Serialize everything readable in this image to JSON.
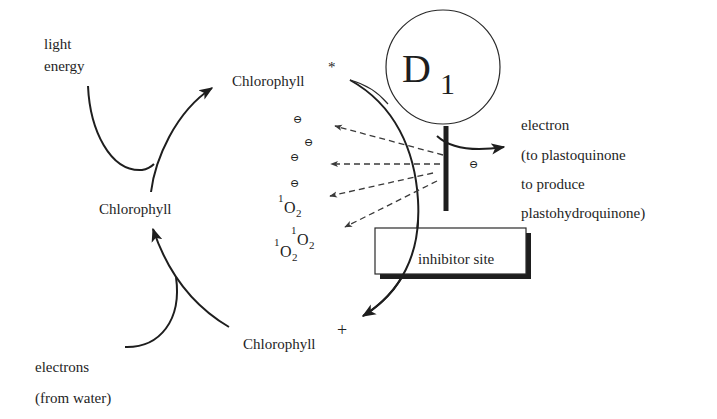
{
  "diagram": {
    "labels": {
      "light_energy": [
        "light",
        "energy"
      ],
      "chlorophyll_ground": "Chlorophyll",
      "chlorophyll_excited": "Chlorophyll",
      "chlorophyll_excited_sup": "*",
      "chlorophyll_cation": "Chlorophyll",
      "chlorophyll_cation_sup": "+",
      "d1_main": "D",
      "d1_sub": "1",
      "electron_out": [
        "electron",
        "(to plastoquinone",
        "to produce",
        "plastohydroquinone)"
      ],
      "electrons_in": [
        "electrons",
        "(from water)"
      ],
      "inhibitor_site": "inhibitor site",
      "minus_symbol": "⊖",
      "singlet_oxygen": {
        "sup": "1",
        "base": "O",
        "sub": "2"
      }
    },
    "colors": {
      "ink": "#1e1e1e",
      "background": "#ffffff"
    }
  }
}
